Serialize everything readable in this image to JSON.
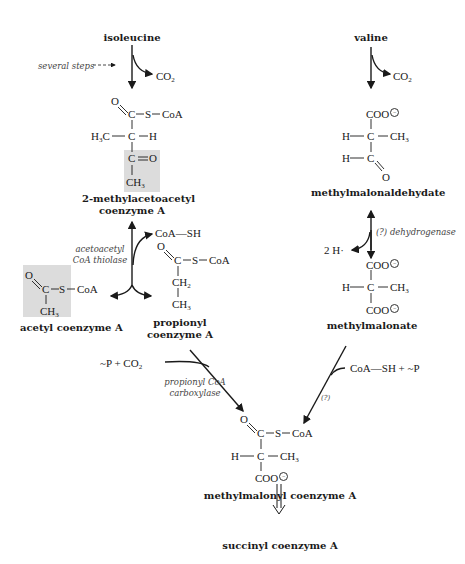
{
  "compounds": {
    "isoleucine": "isoleucine",
    "valine": "valine",
    "methylacetoacetyl": [
      "2-methylacetoacetyl",
      "coenzyme A"
    ],
    "methylmalonaldehydate": "methylmalonaldehydate",
    "acetyl_coa": "acetyl coenzyme A",
    "propionyl_coa": [
      "propionyl",
      "coenzyme A"
    ],
    "methylmalonate": "methylmalonate",
    "methylmalonyl_coa": "methylmalonyl coenzyme A",
    "succinyl_coa": "succinyl coenzyme A"
  },
  "annotations": {
    "several_steps": "several steps",
    "thiolase": [
      "acetoacetyl",
      "CoA thiolase"
    ],
    "dehydrogenase": "(?) dehydrogenase",
    "carboxylase": [
      "propionyl CoA",
      "carboxylase"
    ],
    "unknown_enzyme": "(?)"
  },
  "side_products": {
    "co2_left": "CO2",
    "co2_right": "CO2",
    "coa_sh": "CoA—SH",
    "two_h": "2 H·",
    "p_co2": "~P + CO2",
    "coash_p": "CoA—SH + ~P"
  },
  "structure_atoms": {
    "O": "O",
    "C": "C",
    "S": "S",
    "CoA": "CoA",
    "H": "H",
    "H3C": "H3C",
    "CH3": "CH3",
    "CH2": "CH2",
    "COO": "COO"
  },
  "colors": {
    "highlight": "#dcdcdc",
    "line": "#1a1a1a"
  }
}
